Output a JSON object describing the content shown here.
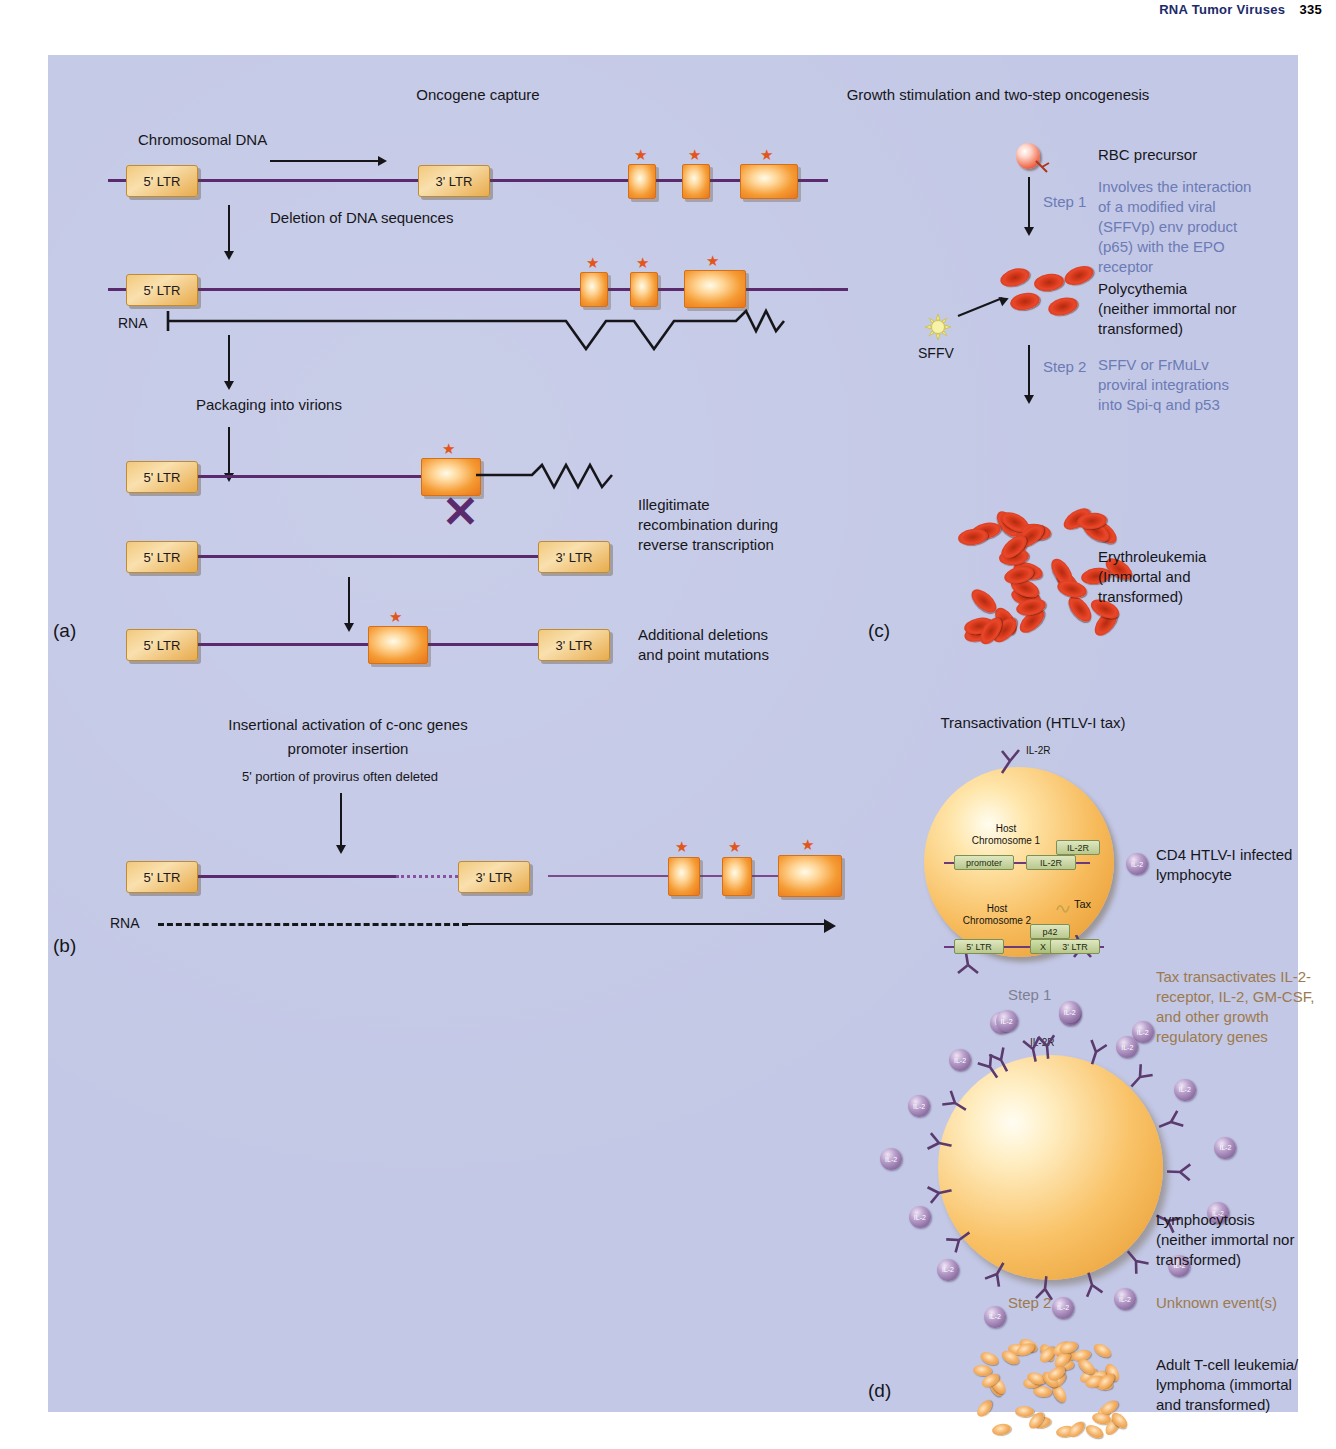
{
  "header": {
    "title": "RNA Tumor Viruses",
    "page": "335"
  },
  "panel_a": {
    "letter": "(a)",
    "title": "Oncogene capture",
    "labels": {
      "chromosomal_dna": "Chromosomal DNA",
      "deletion": "Deletion of DNA sequences",
      "packaging": "Packaging into virions",
      "rna": "RNA",
      "illegitimate": "Illegitimate\nrecombination during\nreverse transcription",
      "additional": "Additional deletions\nand point mutations"
    },
    "ltr5": "5' LTR",
    "ltr3": "3' LTR"
  },
  "panel_b": {
    "letter": "(b)",
    "title_line1": "Insertional activation of c-onc genes",
    "title_line2": "promoter insertion",
    "deleted_note": "5' portion of provirus often deleted",
    "rna": "RNA",
    "ltr5": "5' LTR",
    "ltr3": "3' LTR"
  },
  "panel_c": {
    "letter": "(c)",
    "title": "Growth stimulation and two-step oncogenesis",
    "rbc_precursor": "RBC precursor",
    "step1": "Step 1",
    "step1_note": "Involves the interaction\nof a modified viral\n(SFFVp) env product\n(p65) with the EPO\nreceptor",
    "sffv": "SFFV",
    "polycythemia": "Polycythemia\n(neither immortal nor\ntransformed)",
    "step2": "Step 2",
    "step2_note": "SFFV or FrMuLv\nproviral integrations\ninto Spi-q and p53",
    "erythroleukemia": "Erythroleukemia\n(Immortal and\ntransformed)"
  },
  "panel_d": {
    "letter": "(d)",
    "title": "Transactivation (HTLV-I tax)",
    "il2r_receptor": "IL-2R",
    "host_chr1": "Host\nChromosome 1",
    "host_chr2": "Host\nChromosome 2",
    "promoter": "promoter",
    "il2r_gene": "IL-2R",
    "il2r_box": "IL-2R",
    "il2": "IL-2",
    "tax": "Tax",
    "p42": "p42",
    "x": "X",
    "ltr5": "5' LTR",
    "ltr3": "3' LTR",
    "cd4_label": "CD4 HTLV-I infected\nlymphocyte",
    "step1": "Step 1",
    "tax_note": "Tax transactivates IL-2-\nreceptor, IL-2, GM-CSF,\nand other growth\nregulatory genes",
    "lymphocytosis": "Lymphocytosis\n(neither immortal nor\ntransformed)",
    "step2": "Step 2",
    "unknown": "Unknown event(s)",
    "atl": "Adult T-cell leukemia/\nlymphoma (immortal\nand transformed)"
  },
  "colors": {
    "background": "#c3c8e6",
    "dna": "#5b2a6e",
    "gene": "#f59b33",
    "star": "#e2561c",
    "ltr": "#f2c97e",
    "blue_text": "#6b7bb5",
    "brown_text": "#9c7a4e",
    "rbc": "#d6381a",
    "lymphocyte": "#f5ad4a",
    "il2": "#6e4b85"
  }
}
